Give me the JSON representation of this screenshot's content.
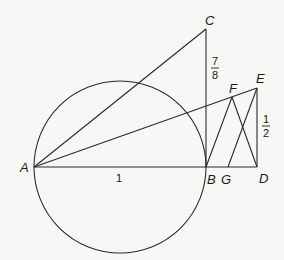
{
  "diagram": {
    "points": {
      "A": {
        "label": "A",
        "x": 34,
        "y": 167
      },
      "B": {
        "label": "B",
        "x": 206,
        "y": 167
      },
      "C": {
        "label": "C",
        "x": 206,
        "y": 29
      },
      "D": {
        "label": "D",
        "x": 257,
        "y": 167
      },
      "E": {
        "label": "E",
        "x": 257,
        "y": 88
      },
      "F": {
        "label": "F",
        "x": 232,
        "y": 97
      },
      "G": {
        "label": "G",
        "x": 228,
        "y": 167
      }
    },
    "circle": {
      "cx": 120,
      "cy": 167,
      "r": 86
    },
    "segments": [
      [
        "A",
        "B"
      ],
      [
        "B",
        "D"
      ],
      [
        "B",
        "C"
      ],
      [
        "A",
        "C"
      ],
      [
        "A",
        "E"
      ],
      [
        "E",
        "D"
      ],
      [
        "B",
        "F"
      ],
      [
        "F",
        "D"
      ],
      [
        "G",
        "E"
      ]
    ],
    "length_labels": {
      "AB": "1",
      "BC_num": "7",
      "BC_den": "8",
      "DE_num": "1",
      "DE_den": "2"
    }
  }
}
